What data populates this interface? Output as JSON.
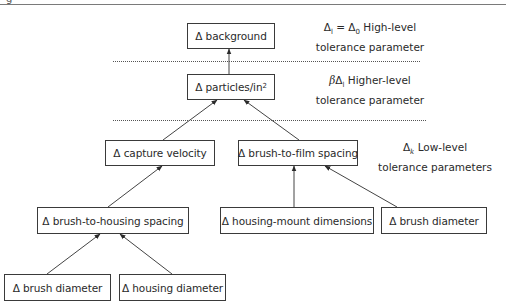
{
  "figure": {
    "partial_label_glyph": "g"
  },
  "nodes": {
    "background": {
      "delta": "Δ",
      "label": "background"
    },
    "particles": {
      "delta": "Δ",
      "label": "particles/in",
      "superscript": "2"
    },
    "capture_velocity": {
      "delta": "Δ",
      "label": "capture velocity"
    },
    "brush_to_film": {
      "delta": "Δ",
      "label": "brush-to-film spacing"
    },
    "brush_to_housing": {
      "delta": "Δ",
      "label": "brush-to-housing spacing"
    },
    "housing_mount": {
      "delta": "Δ",
      "label": "housing-mount dimensions"
    },
    "brush_diameter_right": {
      "delta": "Δ",
      "label": "brush diameter"
    },
    "brush_diameter_left": {
      "delta": "Δ",
      "label": "brush diameter"
    },
    "housing_diameter": {
      "delta": "Δ",
      "label": "housing diameter"
    }
  },
  "annotations": {
    "high_level": {
      "formula_lhs": "Δ",
      "formula_lhs_sub": "l",
      "equals": " = ",
      "formula_rhs": "Δ",
      "formula_rhs_sub": "0",
      "line1_text": " High-level",
      "line2": "tolerance parameter"
    },
    "higher_level": {
      "beta": "β",
      "formula": "Δ",
      "formula_sub": "l",
      "line1_text": " Higher-level",
      "line2": "tolerance parameter"
    },
    "low_level": {
      "formula": "Δ",
      "formula_sub": "k",
      "line1_text": " Low-level",
      "line2": "tolerance parameters"
    }
  },
  "edges": [
    {
      "from": "particles",
      "to": "background"
    },
    {
      "from": "capture_velocity",
      "to": "particles"
    },
    {
      "from": "brush_to_film",
      "to": "particles"
    },
    {
      "from": "brush_to_housing",
      "to": "capture_velocity"
    },
    {
      "from": "housing_mount",
      "to": "brush_to_film"
    },
    {
      "from": "brush_diameter_right",
      "to": "brush_to_film"
    },
    {
      "from": "brush_diameter_left",
      "to": "brush_to_housing"
    },
    {
      "from": "housing_diameter",
      "to": "brush_to_housing"
    }
  ],
  "colors": {
    "line": "#3a3a3a",
    "text": "#2a2a2a",
    "background": "#ffffff"
  }
}
